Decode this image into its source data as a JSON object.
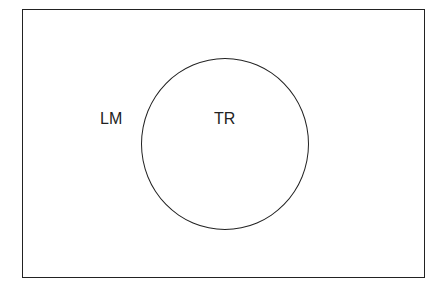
{
  "diagram": {
    "type": "venn",
    "universe_label": "LM",
    "sets": [
      {
        "label": "TR"
      }
    ],
    "colors": {
      "stroke": "#222222",
      "background": "#ffffff"
    }
  }
}
